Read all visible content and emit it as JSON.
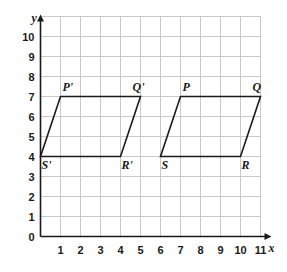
{
  "figure": {
    "axis_labels": {
      "x": "x",
      "y": "y"
    },
    "x_ticks": [
      "0",
      "1",
      "2",
      "3",
      "4",
      "5",
      "6",
      "7",
      "8",
      "9",
      "10",
      "11"
    ],
    "y_ticks": [
      "0",
      "1",
      "2",
      "3",
      "4",
      "5",
      "6",
      "7",
      "8",
      "9",
      "10"
    ],
    "colors": {
      "grid": "#c9c9c9",
      "axis": "#1a1a1a",
      "shape_stroke": "#1a1a1a",
      "background": "#ffffff",
      "text": "#1a1a1a"
    }
  },
  "chart_data": {
    "type": "scatter",
    "title": "",
    "xlabel": "x",
    "ylabel": "y",
    "xlim": [
      0,
      11
    ],
    "ylim": [
      0,
      11
    ],
    "x_ticks": [
      0,
      1,
      2,
      3,
      4,
      5,
      6,
      7,
      8,
      9,
      10,
      11
    ],
    "y_ticks": [
      0,
      1,
      2,
      3,
      4,
      5,
      6,
      7,
      8,
      9,
      10
    ],
    "grid": true,
    "legend": "none",
    "shapes": [
      {
        "name": "parallelogram-image",
        "label": "P'Q'R'S'",
        "closed": true,
        "vertices": [
          {
            "label": "P'",
            "x": 1,
            "y": 7
          },
          {
            "label": "Q'",
            "x": 5,
            "y": 7
          },
          {
            "label": "R'",
            "x": 4,
            "y": 4
          },
          {
            "label": "S'",
            "x": 0,
            "y": 4
          }
        ]
      },
      {
        "name": "parallelogram-preimage",
        "label": "PQRS",
        "closed": true,
        "vertices": [
          {
            "label": "P",
            "x": 7,
            "y": 7
          },
          {
            "label": "Q",
            "x": 11,
            "y": 7
          },
          {
            "label": "R",
            "x": 10,
            "y": 4
          },
          {
            "label": "S",
            "x": 6,
            "y": 4
          }
        ]
      }
    ],
    "annotations": [
      {
        "text": "P'",
        "x": 1,
        "y": 7,
        "placement": "above-right"
      },
      {
        "text": "Q'",
        "x": 5,
        "y": 7,
        "placement": "above-left"
      },
      {
        "text": "R'",
        "x": 4,
        "y": 4,
        "placement": "below-right"
      },
      {
        "text": "S'",
        "x": 0,
        "y": 4,
        "placement": "below-right"
      },
      {
        "text": "P",
        "x": 7,
        "y": 7,
        "placement": "above-right"
      },
      {
        "text": "Q",
        "x": 11,
        "y": 7,
        "placement": "above-left"
      },
      {
        "text": "R",
        "x": 10,
        "y": 4,
        "placement": "below-right"
      },
      {
        "text": "S",
        "x": 6,
        "y": 4,
        "placement": "below-right"
      }
    ]
  }
}
